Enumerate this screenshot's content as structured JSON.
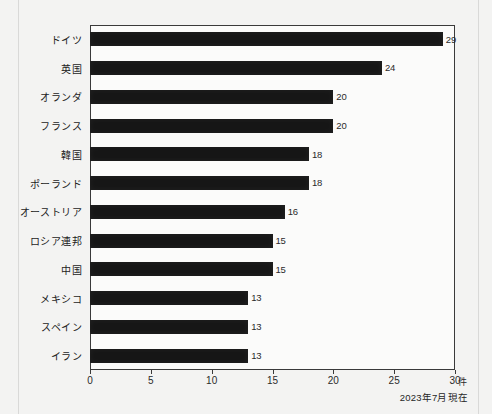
{
  "chart_data": {
    "type": "bar",
    "orientation": "horizontal",
    "title": "",
    "xlabel": "",
    "ylabel": "",
    "unit": "件",
    "xlim": [
      0,
      30
    ],
    "xticks": [
      0,
      5,
      10,
      15,
      20,
      25,
      30
    ],
    "grid": false,
    "legend": null,
    "categories": [
      "ドイツ",
      "英国",
      "オランダ",
      "フランス",
      "韓国",
      "ポーランド",
      "オーストリア",
      "ロシア連邦",
      "中国",
      "メキシコ",
      "スペイン",
      "イラン"
    ],
    "values": [
      29,
      24,
      20,
      20,
      18,
      18,
      16,
      15,
      15,
      13,
      13,
      13
    ],
    "annotations": {
      "footnote": "2023年7月現在"
    }
  },
  "colors": {
    "bar": "#161616",
    "frame": "#3a3a3a",
    "background": "#f3f3f2",
    "plot_background": "#fbfbfa",
    "text": "#1b1b1b"
  }
}
